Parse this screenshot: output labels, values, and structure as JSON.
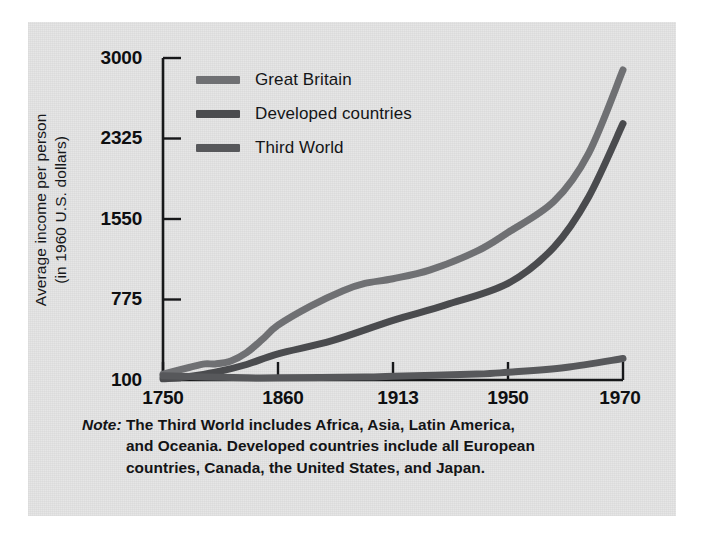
{
  "figure": {
    "background_color": "#e4e4e4",
    "page_color": "#ffffff"
  },
  "axes": {
    "y_title_line1": "Average income per person",
    "y_title_line2": "(in 1960 U.S. dollars)",
    "y_title": "Average income per person (in 1960 U.S. dollars)",
    "x_title": ""
  },
  "note": {
    "label": "Note:",
    "line1": "The Third World includes Africa, Asia, Latin America,",
    "line2": "and Oceania. Developed countries include all European",
    "line3": "countries, Canada, the United States, and Japan.",
    "text": "Note: The Third World includes Africa, Asia, Latin America, and Oceania. Developed countries include all European countries, Canada, the United States, and Japan."
  },
  "legend": {
    "position": "top-left-inside",
    "entries": [
      {
        "label": "Great Britain",
        "color": "#6f7073"
      },
      {
        "label": "Developed countries",
        "color": "#4a4b4e"
      },
      {
        "label": "Third World",
        "color": "#57585b"
      }
    ]
  },
  "chart_data": {
    "type": "line",
    "title": "",
    "xlabel": "",
    "ylabel": "Average income per person (in 1960 U.S. dollars)",
    "grid": false,
    "legend_position": "top-left-inside",
    "x_tick_labels": [
      "1750",
      "1860",
      "1913",
      "1950",
      "1970"
    ],
    "y_tick_labels": [
      "100",
      "775",
      "1550",
      "2325",
      "3000"
    ],
    "y_tick_values": [
      100,
      775,
      1550,
      2325,
      3000
    ],
    "ylim": [
      100,
      3000
    ],
    "x_categories": [
      1750,
      1860,
      1913,
      1950,
      1970
    ],
    "series": [
      {
        "name": "Great Britain",
        "color": "#6f7073",
        "x": [
          1750,
          1775,
          1790,
          1800,
          1815,
          1830,
          1845,
          1860,
          1875,
          1890,
          1900,
          1913,
          1925,
          1940,
          1950,
          1958,
          1964,
          1970
        ],
        "values": [
          150,
          205,
          235,
          235,
          260,
          330,
          440,
          560,
          720,
          860,
          930,
          975,
          1060,
          1240,
          1420,
          1720,
          2180,
          2900
        ]
      },
      {
        "name": "Developed countries",
        "color": "#4a4b4e",
        "x": [
          1750,
          1775,
          1800,
          1830,
          1860,
          1885,
          1913,
          1930,
          1950,
          1958,
          1964,
          1970
        ],
        "values": [
          110,
          130,
          165,
          230,
          320,
          430,
          600,
          730,
          930,
          1280,
          1760,
          2450
        ]
      },
      {
        "name": "Third World",
        "color": "#57585b",
        "x": [
          1750,
          1790,
          1830,
          1860,
          1900,
          1913,
          1940,
          1950,
          1960,
          1970
        ],
        "values": [
          135,
          125,
          118,
          118,
          125,
          132,
          150,
          165,
          205,
          280
        ]
      }
    ]
  }
}
